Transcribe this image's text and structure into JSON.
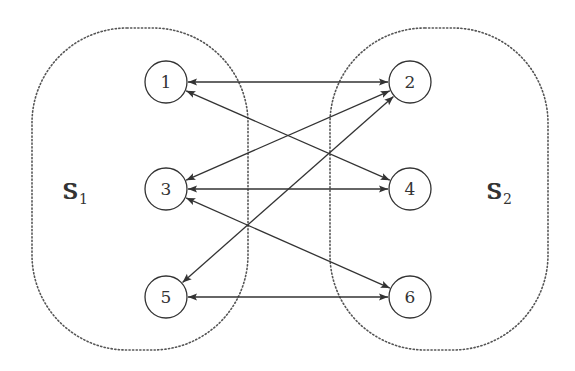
{
  "diagram": {
    "type": "bipartite-graph",
    "sets": [
      {
        "id": "S1",
        "label": "S",
        "subscript": "1",
        "x": 32,
        "y": 28,
        "w": 216,
        "h": 322,
        "label_x": 62,
        "label_y": 199
      },
      {
        "id": "S2",
        "label": "S",
        "subscript": "2",
        "x": 330,
        "y": 28,
        "w": 218,
        "h": 322,
        "label_x": 486,
        "label_y": 199
      }
    ],
    "nodes": [
      {
        "id": "1",
        "label": "1",
        "x": 166,
        "y": 82,
        "set": "S1"
      },
      {
        "id": "2",
        "label": "2",
        "x": 410,
        "y": 82,
        "set": "S2"
      },
      {
        "id": "3",
        "label": "3",
        "x": 166,
        "y": 189,
        "set": "S1"
      },
      {
        "id": "4",
        "label": "4",
        "x": 410,
        "y": 189,
        "set": "S2"
      },
      {
        "id": "5",
        "label": "5",
        "x": 166,
        "y": 297,
        "set": "S1"
      },
      {
        "id": "6",
        "label": "6",
        "x": 410,
        "y": 297,
        "set": "S2"
      }
    ],
    "node_radius": 21,
    "edges": [
      {
        "from": "1",
        "to": "2",
        "bidirectional": true
      },
      {
        "from": "1",
        "to": "4",
        "bidirectional": true
      },
      {
        "from": "3",
        "to": "2",
        "bidirectional": true
      },
      {
        "from": "3",
        "to": "4",
        "bidirectional": true
      },
      {
        "from": "3",
        "to": "6",
        "bidirectional": true
      },
      {
        "from": "5",
        "to": "2",
        "bidirectional": true
      },
      {
        "from": "5",
        "to": "6",
        "bidirectional": true
      }
    ],
    "colors": {
      "stroke": "#333333",
      "set_border": "#555555",
      "background": "#ffffff"
    }
  }
}
